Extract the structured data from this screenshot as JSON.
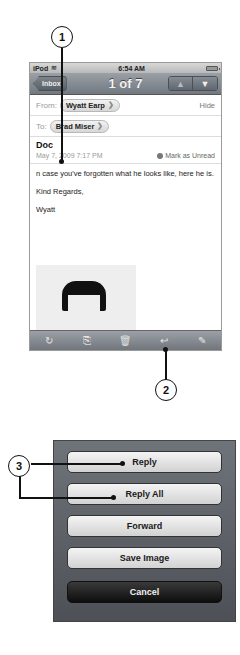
{
  "status_bar": {
    "carrier": "iPod",
    "wifi_icon": "wifi-icon",
    "time": "6:54 AM",
    "battery_icon": "battery-icon"
  },
  "nav_bar": {
    "back_label": "Inbox",
    "title": "1 of 7",
    "prev_icon": "▲",
    "next_icon": "▼"
  },
  "message": {
    "from_label": "From:",
    "from_name": "Wyatt Earp",
    "hide_label": "Hide",
    "to_label": "To:",
    "to_name": "Brad Miser",
    "subject": "Doc",
    "date": "May 7, 2009 7:17 PM",
    "mark_unread_label": "Mark as Unread",
    "body_lines": [
      "n case you've forgotten what he looks like, here he is.",
      "Kind Regards,",
      "Wyatt"
    ],
    "chevron": "❯"
  },
  "toolbar": {
    "refresh_icon": "↻",
    "move_icon": "⎘",
    "trash_icon": "🗑",
    "reply_icon": "↩",
    "compose_icon": "✎"
  },
  "callouts": {
    "one": "1",
    "two": "2",
    "three": "3"
  },
  "action_sheet": {
    "reply": "Reply",
    "reply_all": "Reply All",
    "forward": "Forward",
    "save_image": "Save Image",
    "cancel": "Cancel"
  }
}
